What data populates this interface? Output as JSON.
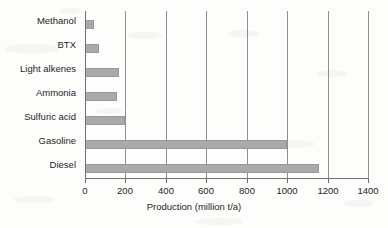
{
  "chart_data": {
    "type": "bar",
    "orientation": "horizontal",
    "title": "",
    "xlabel": "Production (million t/a)",
    "ylabel": "",
    "xlim": [
      0,
      1400
    ],
    "xticks": [
      0,
      200,
      400,
      600,
      800,
      1000,
      1200,
      1400
    ],
    "xtick_labels": [
      "0",
      "200",
      "400",
      "600",
      "800",
      "1000",
      "1200",
      "1400"
    ],
    "grid": "vertical",
    "legend": "none",
    "categories": [
      "Methanol",
      "BTX",
      "Light alkenes",
      "Ammonia",
      "Sulfuric acid",
      "Gasoline",
      "Diesel"
    ],
    "values": [
      45,
      70,
      170,
      160,
      200,
      1000,
      1160
    ],
    "bar_color": "#a9a9a9",
    "bar_edge_color": "#9a9a9a",
    "axis_color": "#6e6e6e",
    "gridline_color": "#8e8e8e",
    "text_color": "#1d1d1d",
    "background_color": "#fdfdfc"
  }
}
